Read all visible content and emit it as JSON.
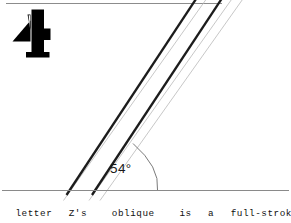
{
  "page": {
    "background_color": "#ffffff",
    "width": 291,
    "height": 223
  },
  "figure": {
    "glyph": {
      "character": "4",
      "name": "numeral-four-glyph",
      "color": "#000000"
    },
    "rules": {
      "top_rule_color": "#8c8c8c",
      "baseline_color": "#8a8a8a"
    },
    "strokes": {
      "primary_color": "#1c1c1c",
      "guide_color": "#b9b9b9",
      "count_primary": 2,
      "count_guide": 3
    },
    "angle": {
      "value": "54°",
      "degrees": 54,
      "arc_color": "#7a7a7a",
      "label_name": "angle-measure-label"
    }
  },
  "caption": {
    "text": "The  letter  Z's   oblique   is  a  full-stroke's"
  }
}
